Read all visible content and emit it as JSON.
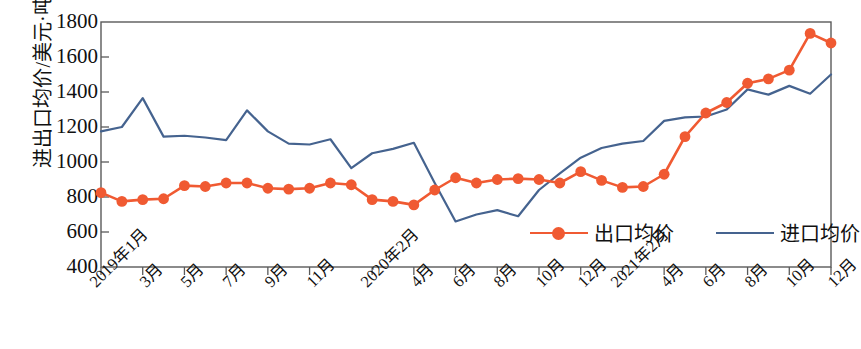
{
  "chart_data": {
    "type": "line",
    "title": "",
    "xlabel": "",
    "ylabel": "进出口均价/美元·吨⁻¹",
    "ylim": [
      400,
      1800
    ],
    "yticks": [
      400,
      600,
      800,
      1000,
      1200,
      1400,
      1600,
      1800
    ],
    "grid": false,
    "legend_position": "inside-bottom-right",
    "x": [
      "2019年1月",
      "2019年2月",
      "2019年3月",
      "2019年4月",
      "2019年5月",
      "2019年6月",
      "2019年7月",
      "2019年8月",
      "2019年9月",
      "2019年10月",
      "2019年11月",
      "2019年12月",
      "2020年1月",
      "2020年2月",
      "2020年3月",
      "2020年4月",
      "2020年5月",
      "2020年6月",
      "2020年7月",
      "2020年8月",
      "2020年9月",
      "2020年10月",
      "2020年11月",
      "2020年12月",
      "2021年1月",
      "2021年2月",
      "2021年3月",
      "2021年4月",
      "2021年5月",
      "2021年6月",
      "2021年7月",
      "2021年8月",
      "2021年9月",
      "2021年10月",
      "2021年11月",
      "2021年12月"
    ],
    "tick_labels": [
      {
        "index": 0,
        "label": "2019年1月"
      },
      {
        "index": 2,
        "label": "3月"
      },
      {
        "index": 4,
        "label": "5月"
      },
      {
        "index": 6,
        "label": "7月"
      },
      {
        "index": 8,
        "label": "9月"
      },
      {
        "index": 10,
        "label": "11月"
      },
      {
        "index": 13,
        "label": "2020年2月"
      },
      {
        "index": 15,
        "label": "4月"
      },
      {
        "index": 17,
        "label": "6月"
      },
      {
        "index": 19,
        "label": "8月"
      },
      {
        "index": 21,
        "label": "10月"
      },
      {
        "index": 23,
        "label": "12月"
      },
      {
        "index": 25,
        "label": "2021年2月"
      },
      {
        "index": 27,
        "label": "4月"
      },
      {
        "index": 29,
        "label": "6月"
      },
      {
        "index": 31,
        "label": "8月"
      },
      {
        "index": 33,
        "label": "10月"
      },
      {
        "index": 35,
        "label": "12月"
      }
    ],
    "series": [
      {
        "name": "出口均价",
        "color": "#F05A32",
        "marker": "circle",
        "values": [
          825,
          775,
          785,
          790,
          865,
          860,
          880,
          880,
          850,
          845,
          850,
          880,
          870,
          785,
          775,
          755,
          840,
          910,
          880,
          900,
          905,
          900,
          880,
          945,
          895,
          855,
          860,
          930,
          1145,
          1280,
          1340,
          1450,
          1475,
          1525,
          1735,
          1680
        ]
      },
      {
        "name": "进口均价",
        "color": "#45638F",
        "marker": "none",
        "values": [
          1175,
          1200,
          1365,
          1145,
          1150,
          1140,
          1125,
          1295,
          1175,
          1105,
          1100,
          1130,
          965,
          1050,
          1075,
          1110,
          880,
          660,
          700,
          725,
          690,
          840,
          935,
          1025,
          1080,
          1105,
          1120,
          1235,
          1255,
          1260,
          1300,
          1415,
          1385,
          1435,
          1390,
          1500
        ]
      }
    ]
  },
  "legend": {
    "items": [
      {
        "label": "出口均价",
        "color": "#F05A32",
        "has_marker": true
      },
      {
        "label": "进口均价",
        "color": "#45638F",
        "has_marker": false
      }
    ]
  },
  "axis": {
    "y_label_main": "进出口均价/美元·吨",
    "y_label_sup": "-1"
  }
}
